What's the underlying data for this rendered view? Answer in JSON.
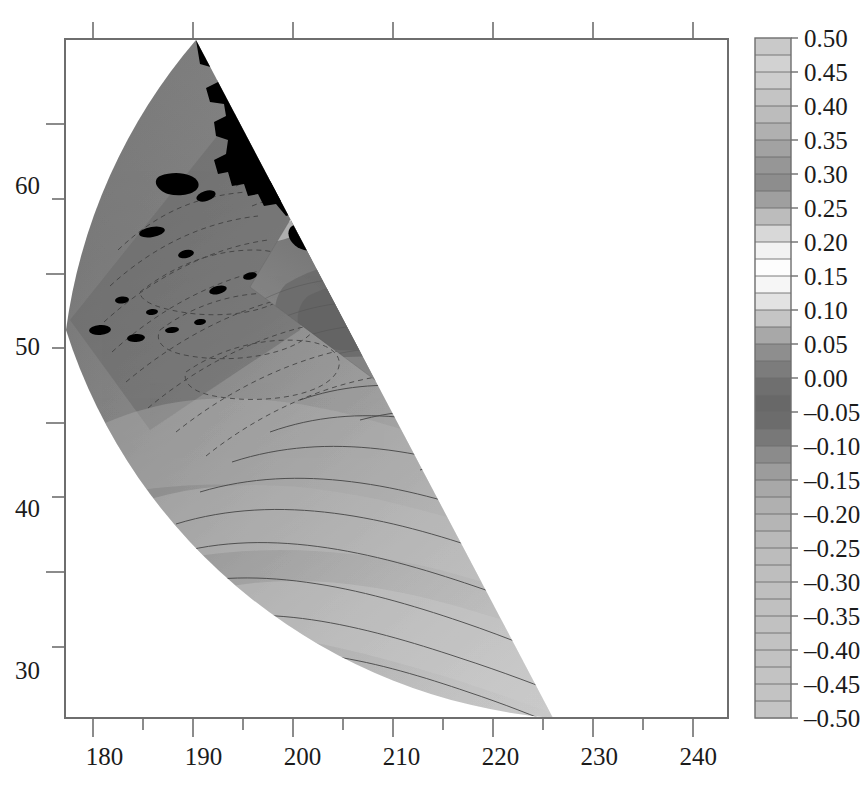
{
  "figure": {
    "background_color": "#ffffff",
    "frame_color": "#6e6e6e",
    "land_color": "#000000",
    "label_color": "#1b1b1b"
  },
  "chart_data": {
    "type": "heatmap",
    "title": "",
    "subtitle": "",
    "xlabel": "",
    "ylabel": "",
    "projection": "conic",
    "grid": false,
    "legend_position": "right",
    "xlim": [
      176,
      243
    ],
    "ylim": [
      27,
      69
    ],
    "x_major_ticks": [
      180,
      190,
      200,
      210,
      220,
      230,
      240
    ],
    "x_minor_ticks": [
      185,
      195,
      205,
      215,
      225,
      235
    ],
    "x_tick_labels": [
      "180",
      "190",
      "200",
      "210",
      "220",
      "230",
      "240"
    ],
    "y_major_ticks": [
      30,
      40,
      50,
      60
    ],
    "y_minor_ticks": [
      35,
      45,
      55,
      65
    ],
    "y_tick_labels": [
      "30",
      "40",
      "50",
      "60"
    ],
    "colorbar": {
      "orientation": "vertical",
      "vmin": -0.5,
      "vmax": 0.5,
      "step": 0.05,
      "tick_labels": [
        "0.50",
        "0.45",
        "0.40",
        "0.35",
        "0.30",
        "0.25",
        "0.20",
        "0.15",
        "0.10",
        "0.05",
        "0.00",
        "–0.05",
        "–0.10",
        "–0.15",
        "–0.20",
        "–0.25",
        "–0.30",
        "–0.35",
        "–0.40",
        "–0.45",
        "–0.50"
      ],
      "tick_values": [
        0.5,
        0.45,
        0.4,
        0.35,
        0.3,
        0.25,
        0.2,
        0.15,
        0.1,
        0.05,
        0.0,
        -0.05,
        -0.1,
        -0.15,
        -0.2,
        -0.25,
        -0.3,
        -0.35,
        -0.4,
        -0.45,
        -0.5
      ],
      "band_colors": [
        "#c9c9c9",
        "#d2d2d2",
        "#cdcdcd",
        "#c4c4c4",
        "#bcbcbc",
        "#b0b0b0",
        "#a2a2a2",
        "#969696",
        "#8d8d8d",
        "#9f9f9f",
        "#bcbcbc",
        "#d8d8d8",
        "#f2f2f2",
        "#fdfdfd",
        "#f6f6f6",
        "#e3e3e3",
        "#c5c5c5",
        "#a8a8a8",
        "#8e8e8e",
        "#7c7c7c",
        "#6f6f6f",
        "#686868",
        "#6c6c6c",
        "#787878",
        "#8b8b8b",
        "#9c9c9c",
        "#a8a8a8",
        "#b0b0b0",
        "#b5b5b5",
        "#b9b9b9",
        "#bcbcbc",
        "#bebebe",
        "#bfbfbf",
        "#c0c0c0",
        "#c1c1c1",
        "#c2c2c2",
        "#c2c2c2",
        "#c3c3c3",
        "#c3c3c3",
        "#c4c4c4"
      ]
    },
    "annotations": [
      {
        "text": "AK",
        "x": 206.5,
        "y": 61.0,
        "color": "#ffffff"
      },
      {
        "text": "CA",
        "x": 237.0,
        "y": 36.6,
        "color": "#ffffff"
      }
    ]
  }
}
